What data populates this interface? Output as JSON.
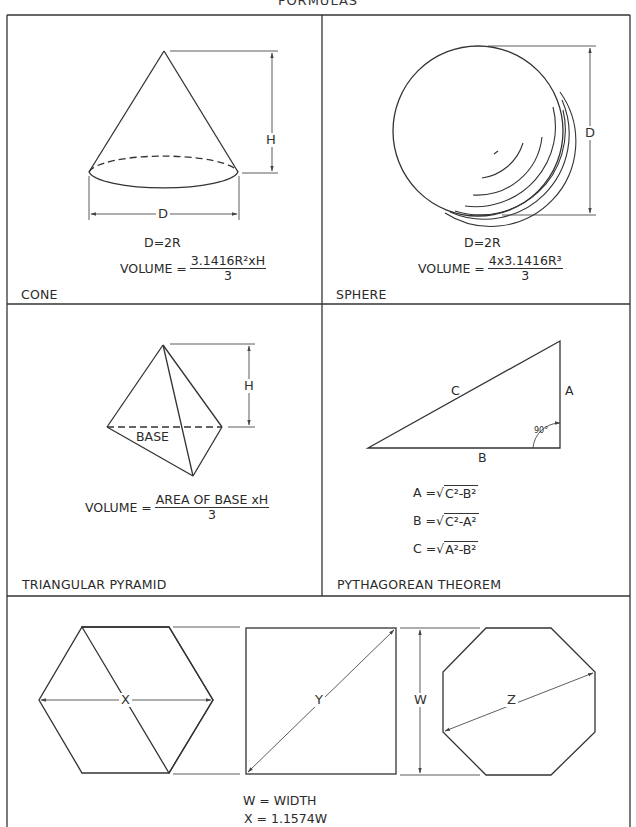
{
  "page": {
    "title": "FORMULAS"
  },
  "panels": {
    "cone": {
      "name": "CONE",
      "dim_h": "H",
      "dim_d": "D",
      "relation": "D=2R",
      "volume_prefix": "VOLUME =",
      "volume_numerator": "3.1416R²xH",
      "volume_denominator": "3"
    },
    "sphere": {
      "name": "SPHERE",
      "dim_d": "D",
      "relation": "D=2R",
      "volume_prefix": "VOLUME =",
      "volume_numerator": "4x3.1416R³",
      "volume_denominator": "3"
    },
    "pyramid": {
      "name": "TRIANGULAR PYRAMID",
      "dim_h": "H",
      "base_label": "BASE",
      "volume_prefix": "VOLUME =",
      "volume_numerator": "AREA OF BASE xH",
      "volume_denominator": "3"
    },
    "pythagorean": {
      "name": "PYTHAGOREAN THEOREM",
      "side_a": "A",
      "side_b": "B",
      "side_c": "C",
      "angle": "90°",
      "formulas": [
        {
          "lhs": "A =",
          "radicand": "C²-B²"
        },
        {
          "lhs": "B =",
          "radicand": "C²-A²"
        },
        {
          "lhs": "C =",
          "radicand": "A²-B²"
        }
      ]
    },
    "polygons": {
      "hexagon_dim": "X",
      "square_dim": "Y",
      "width_dim": "W",
      "octagon_dim": "Z",
      "notes": [
        "W = WIDTH",
        "X = 1.1574W"
      ]
    }
  }
}
